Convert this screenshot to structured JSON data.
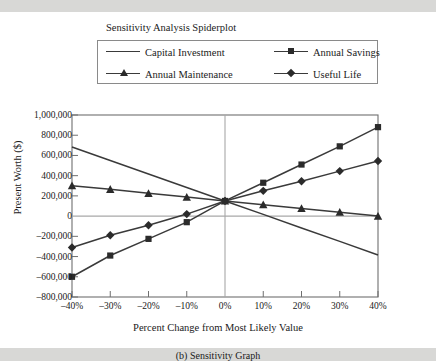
{
  "chart_data": {
    "type": "line",
    "title": "Sensitivity Analysis Spiderplot",
    "caption": "(b) Sensitivity Graph",
    "xlabel": "Percent Change from Most Likely Value",
    "ylabel": "Present Worth ($)",
    "x": [
      -40,
      -30,
      -20,
      -10,
      0,
      10,
      20,
      30,
      40
    ],
    "xtick_labels": [
      "–40%",
      "–30%",
      "–20%",
      "–10%",
      "0%",
      "10%",
      "20%",
      "30%",
      "40%"
    ],
    "ytick_labels": [
      "1,000,000",
      "800,000",
      "600,000",
      "400,000",
      "200,000",
      "0",
      "–200,000",
      "–400,000",
      "–600,000",
      "–800,000"
    ],
    "ytick_values": [
      1000000,
      800000,
      600000,
      400000,
      200000,
      0,
      -200000,
      -400000,
      -600000,
      -800000
    ],
    "ylim": [
      -800000,
      1000000
    ],
    "xlim": [
      -40,
      40
    ],
    "grid": false,
    "legend_position": "top",
    "series": [
      {
        "name": "Capital Investment",
        "marker": "none",
        "values": [
          683000,
          550000,
          417000,
          283000,
          150000,
          17000,
          -117000,
          -250000,
          -385000
        ]
      },
      {
        "name": "Annual Savings",
        "marker": "square",
        "values": [
          -600000,
          -390000,
          -225000,
          -60000,
          150000,
          330000,
          510000,
          690000,
          880000
        ]
      },
      {
        "name": "Annual Maintenance",
        "marker": "triangle",
        "values": [
          300000,
          265000,
          225000,
          188000,
          150000,
          113000,
          75000,
          38000,
          0
        ]
      },
      {
        "name": "Useful Life",
        "marker": "diamond",
        "values": [
          -310000,
          -190000,
          -90000,
          20000,
          150000,
          250000,
          345000,
          445000,
          545000
        ]
      }
    ]
  },
  "colors": {
    "line": "#3a3a3a",
    "marker": "#2b2b2b",
    "axis": "#6f6f6f",
    "zero_line": "#a8a8a8",
    "background": "#ffffff",
    "page": "#d8d8d6"
  }
}
